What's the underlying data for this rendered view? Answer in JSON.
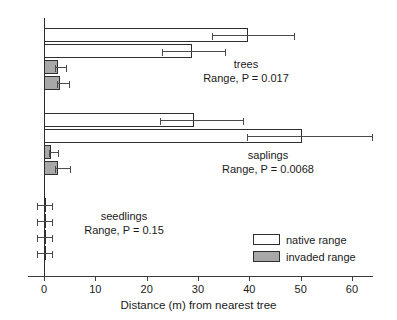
{
  "chart_data": {
    "type": "bar",
    "orientation": "horizontal",
    "title": "",
    "xlabel": "Distance (m) from nearest tree",
    "ylabel": "",
    "xlim": [
      -3,
      66
    ],
    "xticks": [
      0,
      10,
      20,
      30,
      40,
      50,
      60
    ],
    "xtick_labels": [
      "0",
      "10",
      "20",
      "30",
      "40",
      "50",
      "60"
    ],
    "grid": false,
    "legend_position": "lower-right",
    "legend": [
      {
        "key": "native",
        "label": "native range",
        "color": "#ffffff"
      },
      {
        "key": "invaded",
        "label": "invaded range",
        "color": "#a8a8a8"
      }
    ],
    "groups": [
      {
        "name": "trees",
        "annotation": "Range, P = 0.017",
        "p_value": 0.017,
        "bars": [
          {
            "series": "native",
            "value": 39.8,
            "err_low": 32.7,
            "err_high": 48.9
          },
          {
            "series": "native",
            "value": 28.8,
            "err_low": 23.0,
            "err_high": 35.5
          },
          {
            "series": "invaded",
            "value": 2.7,
            "err_low": 2.2,
            "err_high": 4.4
          },
          {
            "series": "invaded",
            "value": 3.2,
            "err_low": 2.6,
            "err_high": 5.0
          }
        ]
      },
      {
        "name": "saplings",
        "annotation": "Range, P = 0.0068",
        "p_value": 0.0068,
        "bars": [
          {
            "series": "native",
            "value": 29.2,
            "err_low": 22.6,
            "err_high": 39.0
          },
          {
            "series": "native",
            "value": 50.3,
            "err_low": 39.6,
            "err_high": 64.1
          },
          {
            "series": "invaded",
            "value": 1.4,
            "err_low": 1.0,
            "err_high": 3.0
          },
          {
            "series": "invaded",
            "value": 2.7,
            "err_low": 2.2,
            "err_high": 5.2
          }
        ]
      },
      {
        "name": "seedlings",
        "annotation": "Range, P = 0.15",
        "p_value": 0.15,
        "bars": [
          {
            "series": "native",
            "value": 0.2,
            "err_low": -1.4,
            "err_high": 1.8
          },
          {
            "series": "native",
            "value": 0.3,
            "err_low": -1.4,
            "err_high": 1.8
          },
          {
            "series": "invaded",
            "value": 0.3,
            "err_low": -1.4,
            "err_high": 1.8
          },
          {
            "series": "invaded",
            "value": 0.4,
            "err_low": -1.4,
            "err_high": 1.8
          }
        ]
      }
    ]
  }
}
